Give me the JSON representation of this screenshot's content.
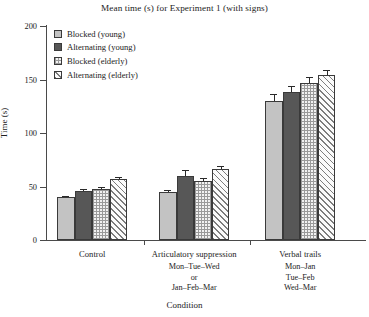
{
  "chart_data": {
    "type": "bar",
    "title": "Mean time (s) for Experiment 1 (with signs)",
    "xlabel": "Condition",
    "ylabel": "Time (s)",
    "ylim": [
      0,
      200
    ],
    "yticks": [
      0,
      50,
      100,
      150,
      200
    ],
    "grid": false,
    "legend_position": "upper left",
    "categories": [
      "Control",
      "Articulatory suppression",
      "Verbal trails"
    ],
    "category_sublabels": [
      [],
      [
        "Mon–Tue–Wed",
        "or",
        "Jan–Feb–Mar"
      ],
      [
        "Mon–Jan",
        "Tue–Feb",
        "Wed–Mar"
      ]
    ],
    "series": [
      {
        "name": "Blocked (young)",
        "values": [
          40,
          45,
          130
        ],
        "errors": [
          1.5,
          2.0,
          6.0
        ],
        "fill": "light-gray",
        "color": "#c3c3c3"
      },
      {
        "name": "Alternating (young)",
        "values": [
          46,
          60,
          138
        ],
        "errors": [
          1.5,
          5.0,
          5.5
        ],
        "fill": "dark-gray",
        "color": "#575757"
      },
      {
        "name": "Blocked (elderly)",
        "values": [
          48,
          55,
          147
        ],
        "errors": [
          1.5,
          2.5,
          5.0
        ],
        "fill": "crosshatch",
        "color": "#f2f2f2"
      },
      {
        "name": "Alternating (elderly)",
        "values": [
          57,
          66,
          154
        ],
        "errors": [
          2.0,
          3.5,
          5.0
        ],
        "fill": "diagonal",
        "color": "#fbfbfb"
      }
    ]
  },
  "legend": {
    "items": [
      {
        "label": "Blocked (young)"
      },
      {
        "label": "Alternating (young)"
      },
      {
        "label": "Blocked (elderly)"
      },
      {
        "label": "Alternating (elderly)"
      }
    ]
  }
}
